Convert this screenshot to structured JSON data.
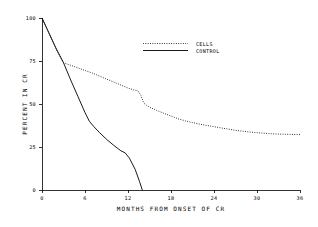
{
  "chart_data": {
    "type": "line",
    "title": "",
    "xlabel": "MONTHS FROM ONSET OF CR",
    "ylabel": "PERCENT IN CR",
    "xlim": [
      0,
      36
    ],
    "ylim": [
      0,
      100
    ],
    "xticks": [
      "0",
      "6",
      "12",
      "18",
      "24",
      "30",
      "36"
    ],
    "yticks": [
      "0",
      "25",
      "50",
      "75",
      "100"
    ],
    "grid": false,
    "legend_position": "top-center",
    "series": [
      {
        "name": "CELLS",
        "style": "dotted",
        "color": "#000000",
        "x": [
          0,
          0.6,
          1.2,
          1.8,
          2.4,
          3.0,
          4.0,
          5.0,
          6.0,
          7.0,
          8.0,
          9.0,
          10.0,
          11.0,
          12.0,
          12.8,
          13.4,
          13.8,
          14.2,
          14.6,
          15.2,
          16.0,
          17.0,
          18.0,
          19.0,
          20.0,
          21.0,
          22.0,
          23.0,
          24.0,
          25.0,
          26.0,
          27.0,
          28.0,
          29.0,
          30.0,
          31.0,
          32.0,
          33.0,
          34.0,
          35.0,
          36.0
        ],
        "y": [
          100,
          94.5,
          89.0,
          83.5,
          78.5,
          74.0,
          72.5,
          71.0,
          69.5,
          68.0,
          66.3,
          64.5,
          62.8,
          61.0,
          59.3,
          58.2,
          57.6,
          55.0,
          50.5,
          49.2,
          47.8,
          46.3,
          44.6,
          43.0,
          41.4,
          40.2,
          39.2,
          38.3,
          37.5,
          36.8,
          36.1,
          35.4,
          34.7,
          34.2,
          33.7,
          33.3,
          33.0,
          32.7,
          32.5,
          32.4,
          32.3,
          32.3
        ]
      },
      {
        "name": "CONTROL",
        "style": "solid",
        "color": "#000000",
        "x": [
          0,
          1.0,
          2.0,
          3.0,
          4.0,
          5.0,
          6.0,
          6.6,
          7.2,
          8.0,
          9.0,
          10.0,
          11.0,
          11.6,
          12.2,
          13.0,
          13.6,
          14.0
        ],
        "y": [
          100,
          91.0,
          82.0,
          74.0,
          64.0,
          54.5,
          45.0,
          40.0,
          37.0,
          33.5,
          29.5,
          26.0,
          22.8,
          21.6,
          18.5,
          12.0,
          5.0,
          0
        ]
      }
    ],
    "annotations": [],
    "plot_geometry": {
      "left_px": 42,
      "right_px": 300,
      "top_px": 18,
      "bottom_px": 190
    }
  },
  "legend": {
    "entries": [
      {
        "label": "CELLS",
        "style": "dotted"
      },
      {
        "label": "CONTROL",
        "style": "solid"
      }
    ]
  }
}
